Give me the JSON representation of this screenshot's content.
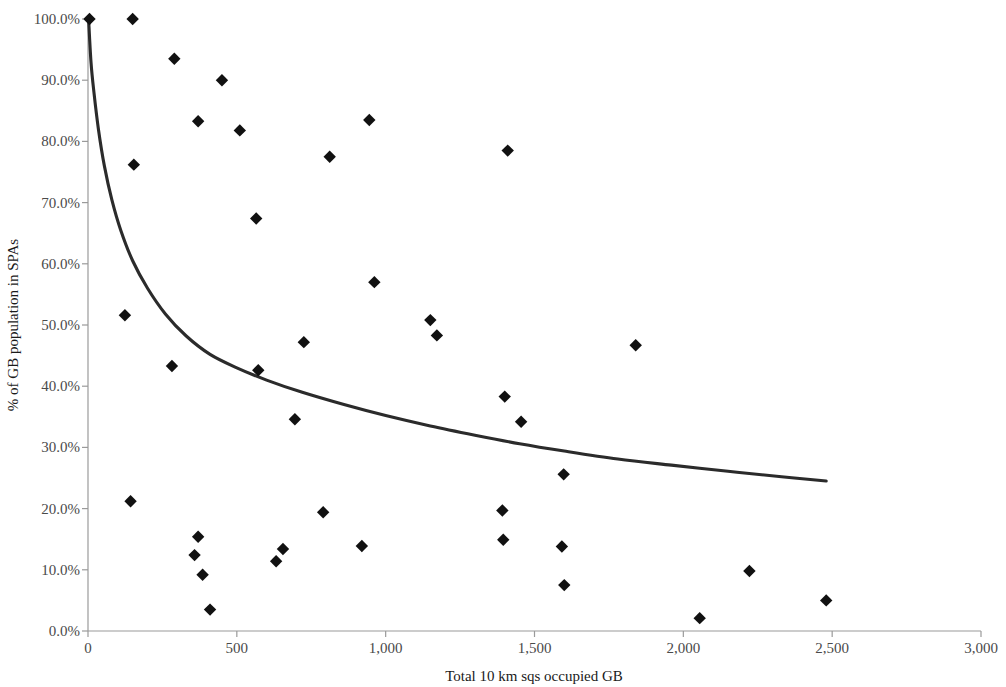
{
  "chart_data": {
    "type": "scatter",
    "title": "",
    "subtitle": "",
    "xlabel": "Total 10 km sqs occupied GB",
    "ylabel": "% of GB population in SPAs",
    "xlim": [
      0,
      3000
    ],
    "ylim": [
      0,
      100
    ],
    "grid": false,
    "legend": null,
    "xticks": [
      0,
      500,
      1000,
      1500,
      2000,
      2500,
      3000
    ],
    "xtick_labels": [
      "0",
      "500",
      "1,000",
      "1,500",
      "2,000",
      "2,500",
      "3,000"
    ],
    "yticks": [
      0,
      10,
      20,
      30,
      40,
      50,
      60,
      70,
      80,
      90,
      100
    ],
    "ytick_labels": [
      "0.0%",
      "10.0%",
      "20.0%",
      "30.0%",
      "40.0%",
      "50.0%",
      "60.0%",
      "70.0%",
      "80.0%",
      "90.0%",
      "100.0%"
    ],
    "marker": "diamond",
    "marker_color": "#111111",
    "points": [
      {
        "x": 5,
        "y": 100.0
      },
      {
        "x": 150,
        "y": 100.0
      },
      {
        "x": 290,
        "y": 93.5
      },
      {
        "x": 450,
        "y": 90.0
      },
      {
        "x": 370,
        "y": 83.3
      },
      {
        "x": 945,
        "y": 83.5
      },
      {
        "x": 510,
        "y": 81.8
      },
      {
        "x": 1410,
        "y": 78.5
      },
      {
        "x": 812,
        "y": 77.5
      },
      {
        "x": 154,
        "y": 76.2
      },
      {
        "x": 565,
        "y": 67.4
      },
      {
        "x": 962,
        "y": 57.0
      },
      {
        "x": 124,
        "y": 51.6
      },
      {
        "x": 1150,
        "y": 50.8
      },
      {
        "x": 1172,
        "y": 48.3
      },
      {
        "x": 725,
        "y": 47.2
      },
      {
        "x": 1840,
        "y": 46.7
      },
      {
        "x": 282,
        "y": 43.3
      },
      {
        "x": 572,
        "y": 42.6
      },
      {
        "x": 1400,
        "y": 38.3
      },
      {
        "x": 1455,
        "y": 34.2
      },
      {
        "x": 695,
        "y": 34.6
      },
      {
        "x": 1598,
        "y": 25.6
      },
      {
        "x": 143,
        "y": 21.2
      },
      {
        "x": 1392,
        "y": 19.7
      },
      {
        "x": 790,
        "y": 19.4
      },
      {
        "x": 370,
        "y": 15.4
      },
      {
        "x": 1395,
        "y": 14.9
      },
      {
        "x": 920,
        "y": 13.9
      },
      {
        "x": 1592,
        "y": 13.8
      },
      {
        "x": 655,
        "y": 13.4
      },
      {
        "x": 358,
        "y": 12.4
      },
      {
        "x": 632,
        "y": 11.4
      },
      {
        "x": 385,
        "y": 9.2
      },
      {
        "x": 2222,
        "y": 9.8
      },
      {
        "x": 1600,
        "y": 7.5
      },
      {
        "x": 2480,
        "y": 5.0
      },
      {
        "x": 410,
        "y": 3.5
      },
      {
        "x": 2055,
        "y": 2.1
      }
    ],
    "trend": {
      "type": "power",
      "description": "decaying power-law trend line",
      "color": "#2b2b2b",
      "points": [
        {
          "x": 2,
          "y": 100.0
        },
        {
          "x": 10,
          "y": 93.0
        },
        {
          "x": 20,
          "y": 88.0
        },
        {
          "x": 35,
          "y": 82.0
        },
        {
          "x": 55,
          "y": 76.0
        },
        {
          "x": 80,
          "y": 70.5
        },
        {
          "x": 110,
          "y": 65.5
        },
        {
          "x": 150,
          "y": 60.5
        },
        {
          "x": 200,
          "y": 56.0
        },
        {
          "x": 260,
          "y": 51.8
        },
        {
          "x": 330,
          "y": 48.2
        },
        {
          "x": 410,
          "y": 45.2
        },
        {
          "x": 500,
          "y": 43.0
        },
        {
          "x": 600,
          "y": 41.0
        },
        {
          "x": 720,
          "y": 39.0
        },
        {
          "x": 860,
          "y": 37.0
        },
        {
          "x": 1000,
          "y": 35.2
        },
        {
          "x": 1150,
          "y": 33.5
        },
        {
          "x": 1300,
          "y": 32.0
        },
        {
          "x": 1450,
          "y": 30.6
        },
        {
          "x": 1600,
          "y": 29.4
        },
        {
          "x": 1780,
          "y": 28.1
        },
        {
          "x": 1960,
          "y": 27.1
        },
        {
          "x": 2150,
          "y": 26.1
        },
        {
          "x": 2330,
          "y": 25.2
        },
        {
          "x": 2480,
          "y": 24.5
        }
      ]
    }
  },
  "axes": {
    "x": {
      "title": "Total 10 km sqs occupied GB"
    },
    "y": {
      "title": "% of GB population in SPAs"
    }
  }
}
